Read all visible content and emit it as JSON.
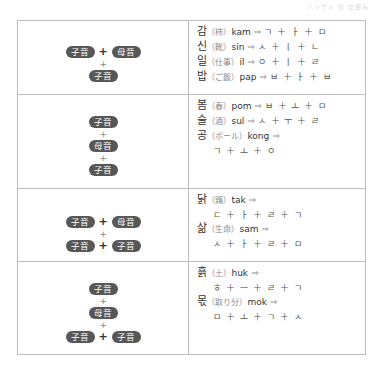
{
  "header": {
    "faint_text": "ハングル の 仕組み"
  },
  "labels": {
    "consonant": "子音",
    "vowel": "母音",
    "plus": "+"
  },
  "rows": [
    {
      "pattern": [
        [
          "子音",
          "母音"
        ],
        [
          "子音"
        ]
      ],
      "examples": [
        {
          "hangul": "감",
          "gloss": "（柿）",
          "roman": "kam",
          "arrow": "⇒",
          "jamo": "ㄱ ＋ ㅏ ＋ ㅁ"
        },
        {
          "hangul": "신",
          "gloss": "（靴）",
          "roman": "sin",
          "arrow": "⇒",
          "jamo": "ㅅ ＋ ㅣ ＋ ㄴ"
        },
        {
          "hangul": "일",
          "gloss": "（仕事）",
          "roman": "il",
          "arrow": "⇒",
          "jamo": "ㅇ ＋ ㅣ ＋ ㄹ"
        },
        {
          "hangul": "밥",
          "gloss": "（ご飯）",
          "roman": "pap",
          "arrow": "⇒",
          "jamo": "ㅂ ＋ ㅏ ＋ ㅂ"
        }
      ]
    },
    {
      "pattern": [
        [
          "子音"
        ],
        [
          "母音"
        ],
        [
          "子音"
        ]
      ],
      "examples": [
        {
          "hangul": "봄",
          "gloss": "（春）",
          "roman": "pom",
          "arrow": "⇒",
          "jamo": "ㅂ ＋ ㅗ ＋ ㅁ"
        },
        {
          "hangul": "술",
          "gloss": "（酒）",
          "roman": "sul",
          "arrow": "⇒",
          "jamo": "ㅅ ＋ ㅜ ＋ ㄹ"
        },
        {
          "hangul": "공",
          "gloss": "（ボール）",
          "roman": "kong",
          "arrow": "⇒",
          "jamo": ""
        },
        {
          "jamo_line": "ㄱ ＋ ㅗ ＋ ㅇ"
        }
      ]
    },
    {
      "pattern": [
        [
          "子音",
          "母音"
        ],
        [
          "子音",
          "子音"
        ]
      ],
      "examples": [
        {
          "hangul": "닭",
          "gloss": "（鶏）",
          "roman": "tak",
          "arrow": "⇒",
          "jamo": ""
        },
        {
          "jamo_line": "ㄷ ＋ ㅏ ＋ ㄹ ＋ ㄱ"
        },
        {
          "hangul": "삶",
          "gloss": "（生命）",
          "roman": "sam",
          "arrow": "⇒",
          "jamo": ""
        },
        {
          "jamo_line": "ㅅ ＋ ㅏ ＋ ㄹ ＋ ㅁ"
        }
      ]
    },
    {
      "pattern": [
        [
          "子音"
        ],
        [
          "母音"
        ],
        [
          "子音",
          "子音"
        ]
      ],
      "examples": [
        {
          "hangul": "흙",
          "gloss": "（土）",
          "roman": "huk",
          "arrow": "⇒",
          "jamo": ""
        },
        {
          "jamo_line": "ㅎ ＋ ㅡ ＋ ㄹ ＋ ㄱ"
        },
        {
          "hangul": "몫",
          "gloss": "（取り分）",
          "roman": "mok",
          "arrow": "⇒",
          "jamo": ""
        },
        {
          "jamo_line": "ㅁ ＋ ㅗ ＋ ㄱ ＋ ㅅ"
        }
      ]
    }
  ]
}
